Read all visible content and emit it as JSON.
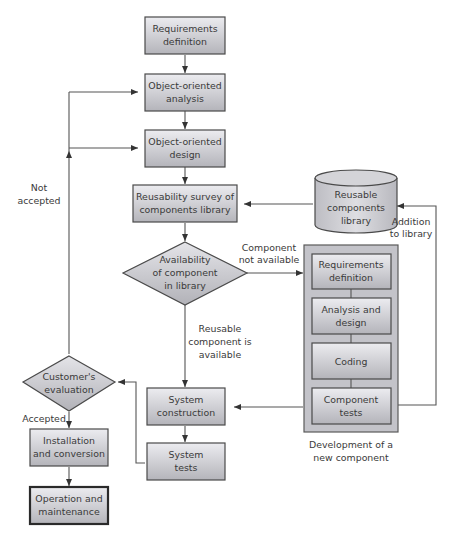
{
  "diagram": {
    "type": "flowchart",
    "colors": {
      "box_fill_top": "#ececf0",
      "box_fill_bottom": "#b8b8be",
      "outer_group_fill": "#bfbfc5",
      "line": "#555555",
      "text": "#3a3a3a"
    },
    "nodes": {
      "requirements_definition": {
        "line1": "Requirements",
        "line2": "definition"
      },
      "oo_analysis": {
        "line1": "Object-oriented",
        "line2": "analysis"
      },
      "oo_design": {
        "line1": "Object-oriented",
        "line2": "design"
      },
      "reusability_survey": {
        "line1": "Reusability survey of",
        "line2": "components library"
      },
      "availability_decision": {
        "line1": "Availability",
        "line2": "of component",
        "line3": "in library"
      },
      "reusable_library": {
        "line1": "Reusable",
        "line2": "components",
        "line3": "library"
      },
      "sub_requirements": {
        "line1": "Requirements",
        "line2": "definition"
      },
      "sub_analysis": {
        "line1": "Analysis and",
        "line2": "design"
      },
      "sub_coding": {
        "line1": "Coding"
      },
      "sub_component_tests": {
        "line1": "Component",
        "line2": "tests"
      },
      "system_construction": {
        "line1": "System",
        "line2": "construction"
      },
      "system_tests": {
        "line1": "System",
        "line2": "tests"
      },
      "customer_evaluation": {
        "line1": "Customer's",
        "line2": "evaluation"
      },
      "installation": {
        "line1": "Installation",
        "line2": "and conversion"
      },
      "operation": {
        "line1": "Operation and",
        "line2": "maintenance"
      }
    },
    "group": {
      "caption_line1": "Development of a",
      "caption_line2": "new component"
    },
    "edge_labels": {
      "not_available_1": "Component",
      "not_available_2": "not available",
      "available_1": "Reusable",
      "available_2": "component is",
      "available_3": "available",
      "addition_1": "Addition",
      "addition_2": "to library",
      "not_accepted_1": "Not",
      "not_accepted_2": "accepted",
      "accepted": "Accepted"
    }
  }
}
